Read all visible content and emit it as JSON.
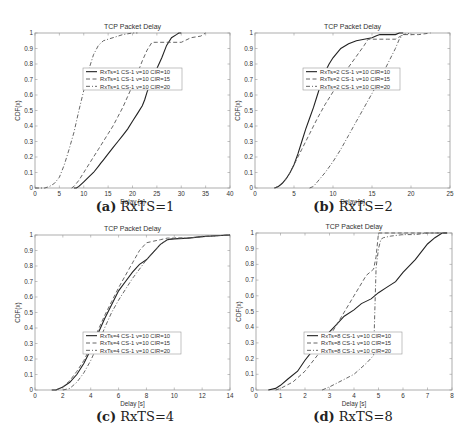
{
  "figure": {
    "panels": [
      {
        "id": "a",
        "caption_tag": "(a)",
        "caption_text": "RxTS=1"
      },
      {
        "id": "b",
        "caption_tag": "(b)",
        "caption_text": "RxTS=2"
      },
      {
        "id": "c",
        "caption_tag": "(c)",
        "caption_text": "RxTS=4"
      },
      {
        "id": "d",
        "caption_tag": "(d)",
        "caption_text": "RxTS=8"
      }
    ]
  },
  "chart_data": [
    {
      "type": "line",
      "title": "TCP Packet Delay",
      "xlabel": "Delay [s]",
      "ylabel": "CDF(x)",
      "xlim": [
        0,
        40
      ],
      "ylim": [
        0,
        1
      ],
      "xticks": [
        0,
        5,
        10,
        15,
        20,
        25,
        30,
        35,
        40
      ],
      "yticks": [
        0,
        0.1,
        0.2,
        0.3,
        0.4,
        0.5,
        0.6,
        0.7,
        0.8,
        0.9,
        1
      ],
      "grid": false,
      "legend_position": "center-upper",
      "legend_box": [
        83,
        68,
        182,
        90
      ],
      "axes_box": [
        35,
        33,
        230,
        188
      ],
      "series": [
        {
          "name": "RxTs=1 CS-1 v=10 CIR=10",
          "style": "solid",
          "x": [
            8,
            8.5,
            9,
            10,
            11,
            12,
            13,
            13.5,
            14,
            15,
            16,
            17,
            18,
            19,
            20,
            21,
            22,
            22.5,
            23,
            24,
            25,
            26,
            27,
            28,
            29,
            29.5,
            30
          ],
          "y": [
            0,
            0,
            0.01,
            0.04,
            0.07,
            0.1,
            0.14,
            0.16,
            0.18,
            0.22,
            0.26,
            0.3,
            0.34,
            0.38,
            0.43,
            0.48,
            0.53,
            0.57,
            0.62,
            0.7,
            0.77,
            0.84,
            0.92,
            0.97,
            0.99,
            1,
            1
          ]
        },
        {
          "name": "RxTs=1 CS-1 v=10 CIR=15",
          "style": "dashed",
          "x": [
            7.5,
            8,
            9,
            10,
            11,
            12,
            13,
            14,
            15,
            16,
            17,
            18,
            19,
            20,
            21,
            22,
            23,
            24,
            25,
            27,
            30,
            32,
            34,
            35
          ],
          "y": [
            0,
            0.01,
            0.05,
            0.1,
            0.15,
            0.2,
            0.25,
            0.3,
            0.35,
            0.4,
            0.46,
            0.52,
            0.59,
            0.66,
            0.74,
            0.82,
            0.89,
            0.94,
            0.94,
            0.94,
            0.94,
            0.97,
            0.98,
            1
          ]
        },
        {
          "name": "RxTs=1 CS-1 v=10 CIR=20",
          "style": "dashdot",
          "x": [
            0,
            2,
            3,
            4,
            5,
            6,
            7,
            8,
            9,
            10,
            11,
            12,
            13,
            14,
            15,
            16,
            18,
            20,
            21
          ],
          "y": [
            0,
            0,
            0.01,
            0.03,
            0.07,
            0.15,
            0.25,
            0.36,
            0.5,
            0.63,
            0.76,
            0.86,
            0.92,
            0.95,
            0.96,
            0.97,
            0.99,
            1,
            1
          ]
        }
      ]
    },
    {
      "type": "line",
      "title": "TCP Packet Delay",
      "xlabel": "Delay [s]",
      "ylabel": "CDF(x)",
      "xlim": [
        0,
        25
      ],
      "ylim": [
        0,
        1
      ],
      "xticks": [
        0,
        5,
        10,
        15,
        20,
        25
      ],
      "yticks": [
        0,
        0.1,
        0.2,
        0.3,
        0.4,
        0.5,
        0.6,
        0.7,
        0.8,
        0.9,
        1
      ],
      "grid": false,
      "legend_position": "center-upper",
      "legend_box": [
        303,
        68,
        400,
        90
      ],
      "axes_box": [
        255,
        33,
        450,
        188
      ],
      "series": [
        {
          "name": "RxTs=2 CS-1 v=10 CIR=10",
          "style": "solid",
          "x": [
            2.5,
            3,
            3.5,
            4,
            4.5,
            5,
            5.5,
            6,
            6.5,
            7,
            7.5,
            8,
            8.5,
            9,
            9.5,
            10,
            10.5,
            11,
            12,
            13,
            14,
            15,
            15.5,
            16,
            17,
            18,
            18.5,
            19
          ],
          "y": [
            0,
            0.01,
            0.03,
            0.06,
            0.1,
            0.15,
            0.22,
            0.3,
            0.38,
            0.45,
            0.52,
            0.6,
            0.68,
            0.75,
            0.8,
            0.84,
            0.87,
            0.9,
            0.93,
            0.95,
            0.96,
            0.97,
            0.98,
            0.99,
            0.99,
            0.99,
            1,
            1
          ]
        },
        {
          "name": "RxTs=2 CS-1 v=10 CIR=15",
          "style": "dashed",
          "x": [
            2.5,
            3,
            3.5,
            4,
            4.5,
            5,
            5.5,
            6,
            7,
            8,
            9,
            10,
            11,
            12,
            13,
            14,
            14.5,
            15,
            16,
            17,
            18,
            19,
            20,
            21,
            22.5
          ],
          "y": [
            0,
            0.01,
            0.03,
            0.06,
            0.1,
            0.15,
            0.2,
            0.25,
            0.35,
            0.45,
            0.54,
            0.62,
            0.7,
            0.78,
            0.85,
            0.92,
            0.96,
            0.96,
            0.96,
            0.96,
            0.96,
            0.99,
            0.99,
            0.99,
            1
          ]
        },
        {
          "name": "RxTs=2 CS-1 v=10 CIR=20",
          "style": "dashdot",
          "x": [
            7,
            7.5,
            8,
            9,
            10,
            11,
            12,
            13,
            14,
            15,
            16,
            17,
            18,
            18.5,
            19,
            20
          ],
          "y": [
            0,
            0.01,
            0.04,
            0.1,
            0.17,
            0.25,
            0.34,
            0.43,
            0.52,
            0.61,
            0.7,
            0.8,
            0.9,
            0.96,
            0.99,
            1
          ]
        }
      ]
    },
    {
      "type": "line",
      "title": "TCP Packet Delay",
      "xlabel": "Delay [s]",
      "ylabel": "CDF(x)",
      "xlim": [
        0,
        14
      ],
      "ylim": [
        0,
        1
      ],
      "xticks": [
        0,
        2,
        4,
        6,
        8,
        10,
        12,
        14
      ],
      "yticks": [
        0,
        0.1,
        0.2,
        0.3,
        0.4,
        0.5,
        0.6,
        0.7,
        0.8,
        0.9,
        1
      ],
      "grid": false,
      "legend_position": "center-lower",
      "legend_box": [
        83,
        332,
        181,
        354
      ],
      "axes_box": [
        35,
        235,
        230,
        390
      ],
      "series": [
        {
          "name": "RxTs=4 CS-1 v=10 CIR=10",
          "style": "solid",
          "x": [
            1.2,
            1.5,
            2,
            2.5,
            3,
            3.5,
            4,
            4.5,
            5,
            5.5,
            6,
            6.5,
            7,
            7.5,
            8,
            8.5,
            9,
            9.5,
            10,
            11,
            12,
            13,
            14
          ],
          "y": [
            0,
            0,
            0.02,
            0.05,
            0.1,
            0.17,
            0.26,
            0.36,
            0.46,
            0.55,
            0.64,
            0.7,
            0.76,
            0.81,
            0.84,
            0.89,
            0.94,
            0.97,
            0.975,
            0.98,
            0.99,
            0.995,
            1
          ]
        },
        {
          "name": "RxTs=4 CS-1 v=10 CIR=15",
          "style": "dashed",
          "x": [
            1.5,
            2,
            2.5,
            3,
            3.5,
            4,
            4.5,
            5,
            5.5,
            6,
            6.5,
            7,
            7.5,
            8,
            8.5,
            9,
            9.5,
            10,
            11,
            12,
            13,
            14
          ],
          "y": [
            0,
            0.02,
            0.06,
            0.12,
            0.19,
            0.28,
            0.38,
            0.48,
            0.57,
            0.66,
            0.74,
            0.82,
            0.9,
            0.95,
            0.96,
            0.97,
            0.98,
            0.98,
            0.98,
            0.99,
            0.995,
            1
          ]
        },
        {
          "name": "RxTs=4 CS-1 v=10 CIR=20",
          "style": "dashdot",
          "x": [
            2,
            2.5,
            3,
            3.5,
            4,
            4.5,
            5,
            5.5,
            6,
            6.5,
            7,
            7.5,
            8,
            8.5,
            9,
            9.5,
            10,
            11,
            12,
            13,
            14
          ],
          "y": [
            0,
            0.01,
            0.05,
            0.11,
            0.19,
            0.29,
            0.4,
            0.5,
            0.58,
            0.65,
            0.72,
            0.78,
            0.84,
            0.89,
            0.94,
            0.97,
            0.98,
            0.98,
            0.99,
            0.995,
            1
          ]
        }
      ]
    },
    {
      "type": "line",
      "title": "TCP Packet Delay",
      "xlabel": "Delay [s]",
      "ylabel": "CDF(x)",
      "xlim": [
        0,
        8
      ],
      "ylim": [
        0,
        1
      ],
      "xticks": [
        0,
        1,
        2,
        3,
        4,
        5,
        6,
        7,
        8
      ],
      "yticks": [
        0,
        0.1,
        0.2,
        0.3,
        0.4,
        0.5,
        0.6,
        0.7,
        0.8,
        0.9,
        1
      ],
      "grid": false,
      "legend_position": "center-lower",
      "legend_box": [
        304,
        332,
        402,
        354
      ],
      "axes_box": [
        256,
        233,
        452,
        390
      ],
      "series": [
        {
          "name": "RxTs=8 CS-1 v=10 CIR=10",
          "style": "solid",
          "x": [
            0.5,
            0.8,
            1,
            1.3,
            1.7,
            2,
            2.3,
            2.6,
            3,
            3.3,
            3.6,
            4,
            4.3,
            4.7,
            5,
            5.3,
            5.7,
            6,
            6.5,
            7,
            7.3,
            7.6,
            7.8
          ],
          "y": [
            0,
            0.01,
            0.03,
            0.07,
            0.12,
            0.19,
            0.25,
            0.31,
            0.37,
            0.42,
            0.47,
            0.51,
            0.55,
            0.58,
            0.62,
            0.65,
            0.69,
            0.75,
            0.83,
            0.93,
            0.97,
            1,
            1
          ]
        },
        {
          "name": "RxTs=8 CS-1 v=10 CIR=15",
          "style": "dashed",
          "x": [
            0.8,
            1,
            1.5,
            2,
            2.5,
            3,
            3.5,
            4,
            4.5,
            4.8,
            4.9,
            5.0,
            5.2,
            5.5,
            6,
            6.5,
            7,
            7.5,
            7.8
          ],
          "y": [
            0,
            0.01,
            0.05,
            0.12,
            0.22,
            0.34,
            0.47,
            0.6,
            0.73,
            0.77,
            0.85,
            1,
            1,
            1,
            1,
            1,
            1,
            1,
            1
          ]
        },
        {
          "name": "RxTs=8 CS-1 v=10 CIR=20",
          "style": "dashdot",
          "x": [
            2.7,
            3,
            3.5,
            4,
            4.5,
            4.8,
            4.85,
            4.9,
            5.0,
            5.1,
            5.2,
            5.5,
            6,
            6.5,
            7,
            7.5,
            7.8
          ],
          "y": [
            0,
            0.02,
            0.06,
            0.1,
            0.17,
            0.22,
            0.5,
            0.78,
            0.9,
            0.96,
            0.97,
            0.98,
            0.99,
            0.99,
            1,
            1,
            1
          ]
        }
      ]
    }
  ]
}
